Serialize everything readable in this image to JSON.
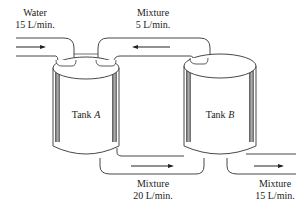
{
  "diagram": {
    "type": "two-tank mixing system",
    "tanks": [
      {
        "id": "A",
        "label_prefix": "Tank ",
        "label_var": "A"
      },
      {
        "id": "B",
        "label_prefix": "Tank ",
        "label_var": "B"
      }
    ],
    "flows": {
      "water_in": {
        "line1": "Water",
        "line2": "15 L/min.",
        "direction": "into Tank A"
      },
      "b_to_a": {
        "line1": "Mixture",
        "line2": "5 L/min.",
        "direction": "Tank B to Tank A"
      },
      "a_to_b": {
        "line1": "Mixture",
        "line2": "20 L/min.",
        "direction": "Tank A to Tank B"
      },
      "out_b": {
        "line1": "Mixture",
        "line2": "15 L/min.",
        "direction": "out of Tank B"
      }
    }
  }
}
